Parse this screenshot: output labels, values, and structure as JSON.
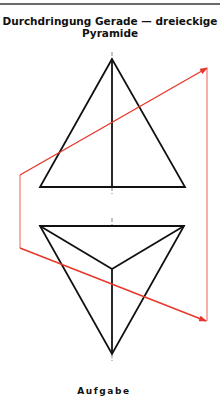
{
  "title": {
    "line1": "Durchdringung Gerade — dreieckige",
    "line2": "Pyramide"
  },
  "caption": "Aufgabe",
  "colors": {
    "outline": "#111111",
    "line": "#e8362a",
    "rule": "#6a6a6a"
  },
  "figure": {
    "upper_view": {
      "name": "front-view",
      "apex": [
        112,
        59
      ],
      "base_left": [
        40,
        187
      ],
      "base_right": [
        185,
        187
      ],
      "base_mid": [
        112,
        187
      ]
    },
    "lower_view": {
      "name": "top-view",
      "top_left": [
        40,
        226
      ],
      "top_right": [
        184,
        226
      ],
      "center": [
        112,
        269
      ],
      "bottom": [
        112,
        354
      ]
    },
    "line": {
      "upper_segment": {
        "from": [
          20,
          175
        ],
        "to": [
          207,
          68
        ]
      },
      "lower_segment": {
        "from": [
          20,
          248
        ],
        "to": [
          206,
          321
        ]
      },
      "left_connector": {
        "from": [
          20,
          175
        ],
        "to": [
          20,
          248
        ]
      },
      "right_connector": {
        "from": [
          207,
          68
        ],
        "to": [
          207,
          321
        ]
      }
    }
  }
}
